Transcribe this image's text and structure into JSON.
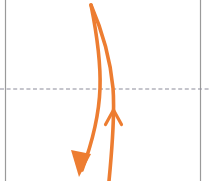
{
  "canvas": {
    "width": 209,
    "height": 181,
    "background": "#ffffff"
  },
  "colors": {
    "arrow_orange": "#ED7D31",
    "guide_gray": "#9a9a9a",
    "dashed_gray": "#8c8c9a",
    "background_white": "#ffffff"
  },
  "guides": {
    "left_vertical": {
      "name": "left boundary line",
      "x": 5.5,
      "y_start": 0,
      "y_end": 181,
      "stroke": "#9a9a9a",
      "stroke_width": 1.2,
      "style": "solid"
    },
    "right_vertical": {
      "name": "right boundary line",
      "x": 200.5,
      "y_start": 0,
      "y_end": 181,
      "stroke": "#9a9a9a",
      "stroke_width": 1.2,
      "style": "solid"
    },
    "horizontal_dashed": {
      "name": "horizontal reference line",
      "y": 89,
      "x_start": 0,
      "x_end": 209,
      "stroke": "#8c8c9a",
      "stroke_width": 1.1,
      "style": "dashed",
      "dash_pattern": "4 2.6"
    }
  },
  "curves": [
    {
      "id": "descending-curve",
      "label": "downward curved arrow",
      "color": "#ED7D31",
      "stroke_width": 3.6,
      "path": "M 91 5 C 96 30, 101 58, 100 88 C 99 118, 91 146, 82 170",
      "arrowhead": {
        "type": "filled-triangle",
        "direction": "down-left",
        "tip_x": 79,
        "tip_y": 177,
        "points": "79,177 71,150 91,154"
      }
    },
    {
      "id": "ascending-curve",
      "label": "upward curved arrow",
      "color": "#ED7D31",
      "stroke_width": 3.6,
      "path": "M 91 5 C 101 28, 110 56, 113 88 C 115 114, 112 150, 109 181",
      "arrowhead": {
        "type": "open-chevron",
        "direction": "up",
        "tip_x": 113.5,
        "tip_y": 110,
        "left_wing": "105,124",
        "right_wing": "122,124"
      }
    }
  ],
  "meta": {
    "element_count": 5
  }
}
